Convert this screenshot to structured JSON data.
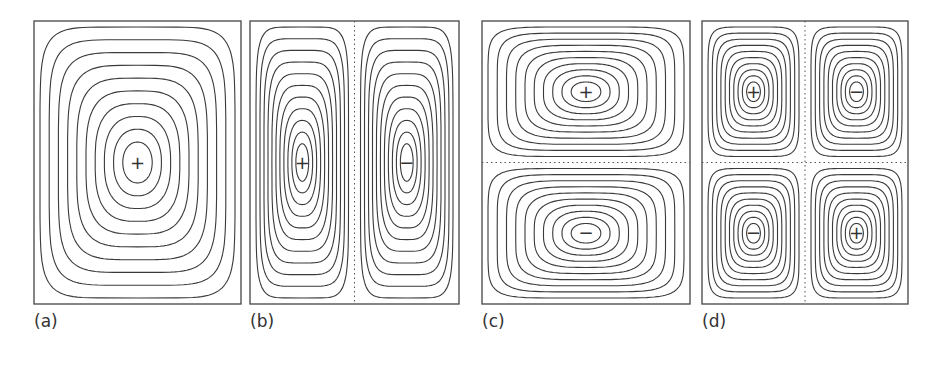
{
  "chart_data": {
    "type": "contour",
    "title": "",
    "panels": [
      {
        "id": "a",
        "label": "(a)",
        "box": [
          34,
          21,
          241,
          304
        ],
        "cells": [
          [
            1,
            1
          ]
        ],
        "signs": [
          [
            "+"
          ]
        ],
        "dividers": {
          "vertical": false,
          "horizontal": false
        },
        "rings": 10
      },
      {
        "id": "b",
        "label": "(b)",
        "box": [
          250,
          21,
          459,
          304
        ],
        "cells": [
          [
            2,
            1
          ]
        ],
        "signs": [
          [
            "+",
            "−"
          ]
        ],
        "dividers": {
          "vertical": true,
          "horizontal": false
        },
        "rings": 11
      },
      {
        "id": "c",
        "label": "(c)",
        "box": [
          482,
          21,
          690,
          304
        ],
        "cells": [
          [
            1,
            2
          ]
        ],
        "signs": [
          [
            "+"
          ],
          [
            "−"
          ]
        ],
        "dividers": {
          "vertical": false,
          "horizontal": true
        },
        "rings": 10
      },
      {
        "id": "d",
        "label": "(d)",
        "box": [
          702,
          21,
          908,
          304
        ],
        "cells": [
          [
            2,
            2
          ]
        ],
        "signs": [
          [
            "+",
            "−"
          ],
          [
            "−",
            "+"
          ]
        ],
        "dividers": {
          "vertical": true,
          "horizontal": true
        },
        "rings": 10
      }
    ],
    "line_color": "#3a3a3a",
    "divider_color": "#555555"
  },
  "labels": {
    "a": "(a)",
    "b": "(b)",
    "c": "(c)",
    "d": "(d)"
  }
}
